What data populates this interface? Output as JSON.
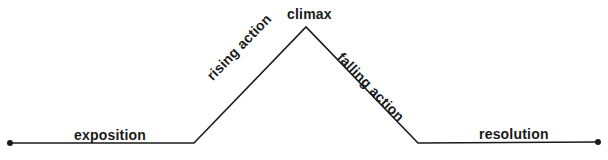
{
  "diagram": {
    "stages": [
      {
        "id": "exposition",
        "label": "exposition"
      },
      {
        "id": "rising_action",
        "label": "rising action"
      },
      {
        "id": "climax",
        "label": "climax"
      },
      {
        "id": "falling_action",
        "label": "falling action"
      },
      {
        "id": "resolution",
        "label": "resolution"
      }
    ],
    "line_color": "#1a1a1a",
    "text_color": "#1a1a1a"
  }
}
